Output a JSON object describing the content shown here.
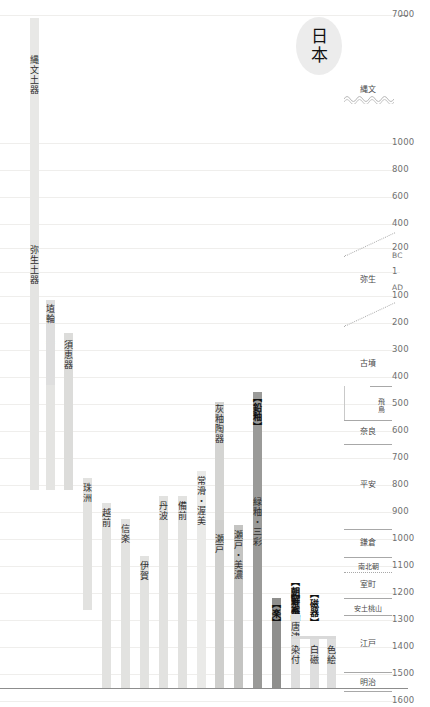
{
  "title": {
    "text": "日本",
    "name": "japan"
  },
  "chart_data": {
    "type": "bar",
    "orientation": "vertical-timeline",
    "xlabel": "",
    "ylabel": "年代",
    "ylim": [
      -7000,
      1900
    ],
    "grid": true,
    "legend": "none",
    "axis_ticks": [
      {
        "label": "7000",
        "value": -7000,
        "y": 15
      },
      {
        "label": "1000",
        "value": -1000,
        "y": 143
      },
      {
        "label": "800",
        "value": -800,
        "y": 170
      },
      {
        "label": "600",
        "value": -600,
        "y": 197
      },
      {
        "label": "400",
        "value": -400,
        "y": 224
      },
      {
        "label": "200",
        "value": -200,
        "y": 248
      },
      {
        "label": "BC",
        "value": null,
        "y": 256
      },
      {
        "label": "1",
        "value": 1,
        "y": 272
      },
      {
        "label": "AD",
        "value": null,
        "y": 288
      },
      {
        "label": "100",
        "value": 100,
        "y": 296
      },
      {
        "label": "200",
        "value": 200,
        "y": 323
      },
      {
        "label": "300",
        "value": 300,
        "y": 350
      },
      {
        "label": "400",
        "value": 400,
        "y": 377
      },
      {
        "label": "500",
        "value": 500,
        "y": 404
      },
      {
        "label": "600",
        "value": 600,
        "y": 431
      },
      {
        "label": "700",
        "value": 700,
        "y": 458
      },
      {
        "label": "800",
        "value": 800,
        "y": 485
      },
      {
        "label": "900",
        "value": 900,
        "y": 512
      },
      {
        "label": "1000",
        "value": 1000,
        "y": 539
      },
      {
        "label": "1100",
        "value": 1100,
        "y": 566
      },
      {
        "label": "1200",
        "value": 1200,
        "y": 593
      },
      {
        "label": "1300",
        "value": 1300,
        "y": 620
      },
      {
        "label": "1400",
        "value": 1400,
        "y": 647
      },
      {
        "label": "1500",
        "value": 1500,
        "y": 674
      },
      {
        "label": "1600",
        "value": 1600,
        "y": 701
      },
      {
        "label": "1700",
        "value": 1700,
        "y": 728
      },
      {
        "label": "1800",
        "value": 1800,
        "y": 755
      },
      {
        "label": "1900",
        "value": 1900,
        "y": 782
      }
    ],
    "eras": [
      {
        "name": "縄文",
        "romaji": "Jomon",
        "top": 80,
        "bottom": 120,
        "label_y": 82
      },
      {
        "name": "弥生",
        "romaji": "Yayoi",
        "top": 255,
        "bottom": 300,
        "label_y": 272
      },
      {
        "name": "古墳",
        "romaji": "Kofun",
        "top": 325,
        "bottom": 400,
        "label_y": 356
      },
      {
        "name": "飛鳥",
        "romaji": "Asuka",
        "top": 386,
        "bottom": 420,
        "label_y": 390
      },
      {
        "name": "奈良",
        "romaji": "Nara",
        "top": 420,
        "bottom": 444,
        "label_y": 424
      },
      {
        "name": "平安",
        "romaji": "Heian",
        "top": 444,
        "bottom": 529,
        "label_y": 477
      },
      {
        "name": "鎌倉",
        "romaji": "Kamakura",
        "top": 529,
        "bottom": 557,
        "label_y": 535
      },
      {
        "name": "南北朝",
        "romaji": "Nanbokucho",
        "top": 557,
        "bottom": 572,
        "label_y": 559
      },
      {
        "name": "室町",
        "romaji": "Muromachi",
        "top": 572,
        "bottom": 598,
        "label_y": 577
      },
      {
        "name": "安土桃山",
        "romaji": "Azuchi-Momoyama",
        "top": 598,
        "bottom": 615,
        "label_y": 601
      },
      {
        "name": "江戸",
        "romaji": "Edo",
        "top": 615,
        "bottom": 672,
        "label_y": 636
      },
      {
        "name": "明治",
        "romaji": "Meiji",
        "top": 672,
        "bottom": 691,
        "label_y": 675
      }
    ],
    "bars": [
      {
        "label": "縄文土器",
        "romaji": "Jomon doki",
        "x": 30,
        "w": 9,
        "top": 18,
        "bottom": 490,
        "color": "#e8e8e6",
        "label_y": 55,
        "bold": false
      },
      {
        "label": "弥生土器",
        "romaji": "Yayoi doki",
        "x": 30,
        "w": 9,
        "top": 240,
        "bottom": 490,
        "color": "#e4e4e2",
        "label_y": 245,
        "bold": false
      },
      {
        "label": "土師器",
        "romaji": "Haji ki",
        "x": 46,
        "w": 9,
        "top": 308,
        "bottom": 490,
        "color": "#e4e4e2",
        "label_y": 317,
        "bold": false
      },
      {
        "label": "埴輪",
        "romaji": "Haniwa",
        "x": 46,
        "w": 9,
        "top": 300,
        "bottom": 385,
        "color": "#dedede",
        "label_y": 304,
        "bold": false
      },
      {
        "label": "須恵器",
        "romaji": "Sue ki",
        "x": 64,
        "w": 9,
        "top": 333,
        "bottom": 490,
        "color": "#dcdcda",
        "label_y": 340,
        "bold": false
      },
      {
        "label": "珠洲",
        "romaji": "Suzu",
        "x": 83,
        "w": 9,
        "top": 478,
        "bottom": 610,
        "color": "#e2e2e0",
        "label_y": 483,
        "bold": false
      },
      {
        "label": "越前",
        "romaji": "Echizen",
        "x": 102,
        "w": 9,
        "top": 503,
        "bottom": 688,
        "color": "#e2e2e0",
        "label_y": 508,
        "bold": false
      },
      {
        "label": "信楽",
        "romaji": "Shigaraki",
        "x": 121,
        "w": 9,
        "top": 519,
        "bottom": 688,
        "color": "#e2e2e0",
        "label_y": 524,
        "bold": false
      },
      {
        "label": "伊賀",
        "romaji": "Iga",
        "x": 140,
        "w": 9,
        "top": 556,
        "bottom": 688,
        "color": "#e2e2e0",
        "label_y": 561,
        "bold": false
      },
      {
        "label": "丹波",
        "romaji": "Tamba",
        "x": 159,
        "w": 9,
        "top": 496,
        "bottom": 688,
        "color": "#e2e2e0",
        "label_y": 501,
        "bold": false
      },
      {
        "label": "備前",
        "romaji": "Bizen",
        "x": 178,
        "w": 9,
        "top": 496,
        "bottom": 688,
        "color": "#e2e2e0",
        "label_y": 501,
        "bold": false
      },
      {
        "label": "常滑・渥美",
        "romaji": "Tokoname/Atsumi",
        "x": 197,
        "w": 9,
        "top": 471,
        "bottom": 688,
        "color": "#eaeae8",
        "label_y": 476,
        "bold": false
      },
      {
        "label": "灰釉陶器",
        "romaji": "Kaiyu toki",
        "x": 215,
        "w": 9,
        "top": 402,
        "bottom": 520,
        "color": "#d4d4d2",
        "label_y": 404,
        "bold": false
      },
      {
        "label": "瀬戸",
        "romaji": "Seto",
        "x": 215,
        "w": 9,
        "top": 520,
        "bottom": 688,
        "color": "#cfcfcd",
        "label_y": 534,
        "bold": false
      },
      {
        "label": "瀬戸・美濃",
        "romaji": "Seto/Mino",
        "x": 234,
        "w": 9,
        "top": 525,
        "bottom": 688,
        "color": "#c4c4c2",
        "label_y": 530,
        "bold": false
      },
      {
        "label": "【鉛釉】",
        "romaji": "Enyu",
        "x": 253,
        "w": 9,
        "top": 392,
        "bottom": 688,
        "color": "#9a9a98",
        "label_y": 393,
        "bold": true
      },
      {
        "label": "緑釉・三彩",
        "romaji": "Ryokuyu/Sansai",
        "x": 253,
        "w": 0,
        "top": 0,
        "bottom": 0,
        "color": "#9a9a98",
        "label_y": 497,
        "bold": false
      },
      {
        "label": "【楽】",
        "romaji": "Raku",
        "x": 272,
        "w": 9,
        "top": 598,
        "bottom": 688,
        "color": "#8f8f8d",
        "label_y": 599,
        "bold": true
      },
      {
        "label": "【京焼】",
        "romaji": "Kyoyaki",
        "x": 291,
        "w": 9,
        "top": 588,
        "bottom": 688,
        "color": "#a5a5a3",
        "label_y": 589,
        "bold": true
      },
      {
        "label": "【朝鮮系】",
        "romaji": "Chosen-kei",
        "x": 291,
        "w": 0,
        "top": 0,
        "bottom": 0,
        "color": "#8f8f8d",
        "label_y": 577,
        "bold": true
      },
      {
        "label": "唐津・萩",
        "romaji": "Karatsu/Hagi",
        "x": 291,
        "w": 9,
        "top": 614,
        "bottom": 688,
        "color": "#dedede",
        "label_y": 622,
        "bold": false
      },
      {
        "label": "【磁器】",
        "romaji": "Jiki",
        "x": 310,
        "w": 0,
        "top": 0,
        "bottom": 0,
        "color": "#d6d6d4",
        "label_y": 589,
        "bold": true
      },
      {
        "label": "染付",
        "romaji": "Sometsuke",
        "x": 291,
        "w": 9,
        "top": 636,
        "bottom": 688,
        "color": "#dedede",
        "label_y": 645,
        "bold": false
      },
      {
        "label": "白磁",
        "romaji": "Hakuji",
        "x": 310,
        "w": 9,
        "top": 636,
        "bottom": 688,
        "color": "#dedede",
        "label_y": 645,
        "bold": false
      },
      {
        "label": "色絵",
        "romaji": "Iroe",
        "x": 327,
        "w": 9,
        "top": 636,
        "bottom": 688,
        "color": "#dedede",
        "label_y": 645,
        "bold": false
      }
    ]
  },
  "labels": {
    "jomon_doki": "縄文土器",
    "yayoi_doki": "弥生土器",
    "haji": "土師器",
    "haniwa": "埴輪",
    "sue": "須恵器",
    "suzu": "珠洲",
    "echizen": "越前",
    "shigaraki": "信楽",
    "iga": "伊賀",
    "tamba": "丹波",
    "bizen": "備前",
    "tokoname": "常滑・渥美",
    "kaiyu": "灰釉陶器",
    "seto": "瀬戸",
    "seto_mino": "瀬戸・美濃",
    "enyu": "【鉛釉】",
    "ryokuyu": "緑釉・三彩",
    "raku": "【楽】",
    "kyoyaki": "【京焼】",
    "chosen": "【朝鮮系】",
    "karatsu": "唐津・萩",
    "jiki": "【磁器】",
    "sometsuke": "染付",
    "hakuji": "白磁",
    "iroe": "色絵"
  },
  "eras": {
    "jomon": "縄文",
    "yayoi": "弥生",
    "kofun": "古墳",
    "asuka": "飛鳥",
    "nara": "奈良",
    "heian": "平安",
    "kamakura": "鎌倉",
    "nanbokucho": "南北朝",
    "muromachi": "室町",
    "azuchi": "安土桃山",
    "edo": "江戸",
    "meiji": "明治"
  },
  "colors": {
    "background": "#ffffff",
    "grid": "#efeeec",
    "axis_text": "#707070",
    "bar_light": "#e4e4e2",
    "bar_mid": "#c4c4c2",
    "bar_dark": "#9a9a98",
    "bubble": "#ececec"
  }
}
